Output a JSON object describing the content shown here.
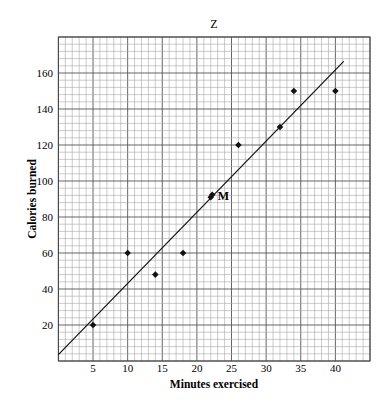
{
  "chart_data": {
    "type": "scatter",
    "title": "Z",
    "xlabel": "Minutes exercised",
    "ylabel": "Calories burned",
    "xlim": [
      0,
      45
    ],
    "ylim": [
      0,
      180
    ],
    "x_ticks": [
      5,
      10,
      15,
      20,
      25,
      30,
      35,
      40
    ],
    "y_ticks": [
      20,
      40,
      60,
      80,
      100,
      120,
      140,
      160
    ],
    "grid": true,
    "legend": null,
    "series": [
      {
        "name": "observations",
        "marker": "diamond",
        "points": [
          {
            "x": 5,
            "y": 20
          },
          {
            "x": 10,
            "y": 60
          },
          {
            "x": 14,
            "y": 48
          },
          {
            "x": 18,
            "y": 60
          },
          {
            "x": 22,
            "y": 91
          },
          {
            "x": 26,
            "y": 120
          },
          {
            "x": 32,
            "y": 130
          },
          {
            "x": 34,
            "y": 150
          },
          {
            "x": 40,
            "y": 150
          }
        ]
      }
    ],
    "trend_line": {
      "x0": 0,
      "y0": 3.5,
      "x1": 41.2,
      "y1": 166.5
    },
    "annotations": [
      {
        "text": "M",
        "x": 22,
        "y": 91
      }
    ]
  }
}
